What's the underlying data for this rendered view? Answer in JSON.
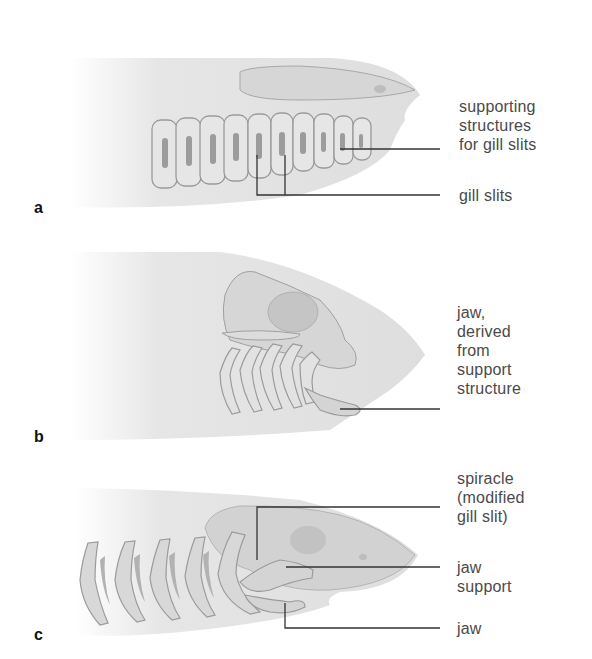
{
  "figure": {
    "panels": [
      {
        "letter": "a",
        "labels": {
          "supporting": [
            "supporting",
            "structures",
            "for gill slits"
          ],
          "gill_slits": "gill slits"
        }
      },
      {
        "letter": "b",
        "labels": {
          "jaw_derived": [
            "jaw,",
            "derived",
            "from",
            "support",
            "structure"
          ]
        }
      },
      {
        "letter": "c",
        "labels": {
          "spiracle": [
            "spiracle",
            "(modified",
            "gill slit)"
          ],
          "jaw_support": [
            "jaw",
            "support"
          ],
          "jaw": "jaw"
        }
      }
    ],
    "colors": {
      "body_fill": "#e4e4e4",
      "cartilage_fill": "#d9d9d9",
      "outline": "#8a8a8a",
      "leader_line": "#333333",
      "label_text": "#4a4a4a"
    }
  }
}
